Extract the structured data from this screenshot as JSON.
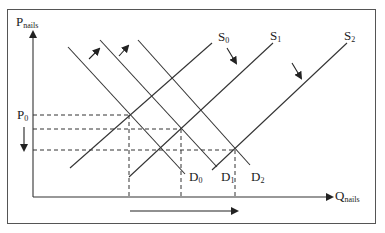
{
  "diagram": {
    "y_axis": {
      "label": "P",
      "label_sub": "nails"
    },
    "x_axis": {
      "label": "Q",
      "label_sub": "nails"
    },
    "price_label": {
      "text": "P",
      "sub": "0"
    },
    "demand_curves": [
      {
        "name": "D",
        "sub": "0"
      },
      {
        "name": "D",
        "sub": "1"
      },
      {
        "name": "D",
        "sub": "2"
      }
    ],
    "supply_curves": [
      {
        "name": "S",
        "sub": "0"
      },
      {
        "name": "S",
        "sub": "1"
      },
      {
        "name": "S",
        "sub": "2"
      }
    ],
    "shift_arrows": {
      "demand": "up-right",
      "supply": "down-right",
      "price": "down",
      "quantity": "right"
    },
    "colors": {
      "line": "#333333",
      "frame": "#555555",
      "background": "#ffffff"
    }
  }
}
